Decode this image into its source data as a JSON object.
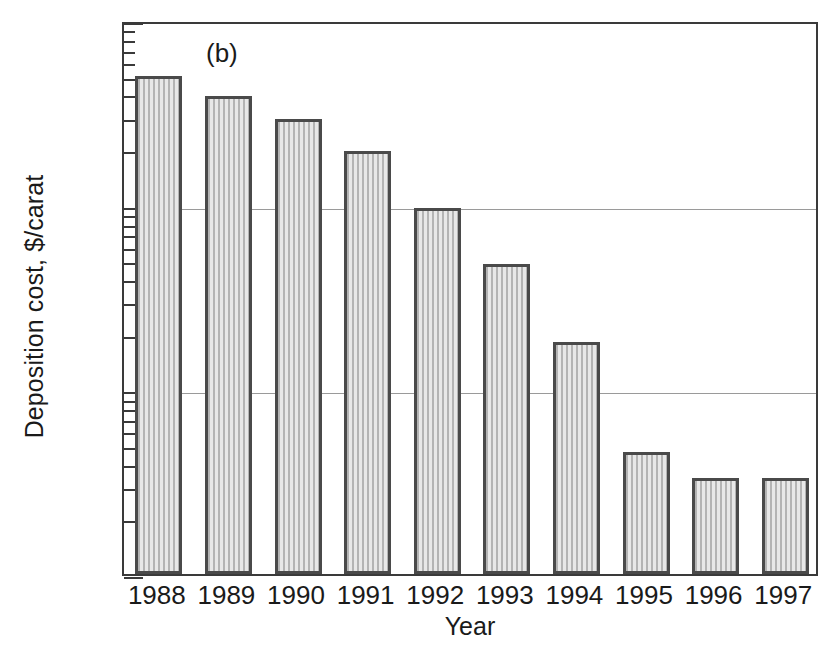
{
  "chart_data": {
    "type": "bar",
    "title": "",
    "panel_label": "(b)",
    "xlabel": "Year",
    "ylabel": "Deposition cost, $/carat",
    "yscale": "log",
    "ylim": [
      1,
      1000
    ],
    "ytick_labels": [
      "1000",
      "100",
      "10",
      "1"
    ],
    "ytick_values": [
      1000,
      100,
      10,
      1
    ],
    "grid": true,
    "grid_axis": "y",
    "legend": "none",
    "categories": [
      "1988",
      "1989",
      "1990",
      "1991",
      "1992",
      "1993",
      "1994",
      "1995",
      "1996",
      "1997"
    ],
    "values": [
      500,
      390,
      290,
      195,
      96,
      48,
      18,
      4.6,
      3.3,
      3.3
    ],
    "bar_color": "#cfcfcf",
    "bar_edge_color": "#4a4a4a"
  }
}
